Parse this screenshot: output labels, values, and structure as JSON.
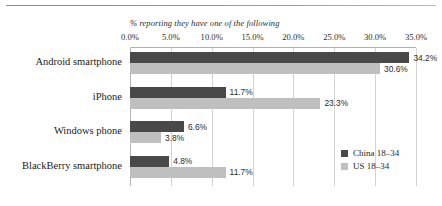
{
  "chart_data": {
    "type": "bar",
    "orientation": "horizontal",
    "title": "% reporting they have one of the following",
    "xlabel": "",
    "ylabel": "",
    "xlim": [
      0,
      35
    ],
    "grid": true,
    "legend_position": "bottom-right",
    "xticks": [
      "0.0%",
      "5.0%",
      "10.0%",
      "15.0%",
      "20.0%",
      "25.0%",
      "30.0%",
      "35.0%"
    ],
    "xtick_values": [
      0,
      5,
      10,
      15,
      20,
      25,
      30,
      35
    ],
    "categories": [
      "Android smartphone",
      "iPhone",
      "Windows phone",
      "BlackBerry smartphone"
    ],
    "series": [
      {
        "name": "China 18–34",
        "color": "#494949",
        "values": [
          34.2,
          11.7,
          6.6,
          4.8
        ],
        "labels": [
          "34.2%",
          "11.7%",
          "6.6%",
          "4.8%"
        ]
      },
      {
        "name": "US 18–34",
        "color": "#bfbfbf",
        "values": [
          30.6,
          23.3,
          3.8,
          11.7
        ],
        "labels": [
          "30.6%",
          "23.3%",
          "3.8%",
          "11.7%"
        ]
      }
    ]
  },
  "legend": {
    "items": [
      {
        "label": "China 18–34",
        "color": "#494949"
      },
      {
        "label": "US 18–34",
        "color": "#bfbfbf"
      }
    ]
  },
  "footer": {
    "note": ""
  }
}
